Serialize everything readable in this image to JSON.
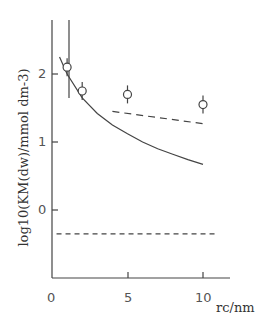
{
  "chart_data": {
    "type": "scatter",
    "title": "",
    "xlabel": "r_c/nm",
    "ylabel": "log10(KM(dw)/mmol dm-3)",
    "xlim": [
      0,
      11
    ],
    "ylim": [
      -1,
      2.8
    ],
    "xticks": [
      "0",
      "5",
      "10"
    ],
    "yticks": [
      "0",
      "1",
      "2"
    ],
    "grid": false,
    "series": [
      {
        "name": "experimental",
        "style": "open circles with error bars",
        "x": [
          1,
          2,
          5,
          10
        ],
        "y": [
          2.1,
          1.75,
          1.7,
          1.55
        ]
      },
      {
        "name": "model solid curve",
        "style": "solid line",
        "x": [
          0.5,
          1,
          2,
          3,
          4,
          5,
          6,
          7,
          8,
          9,
          10
        ],
        "y": [
          2.25,
          2.0,
          1.65,
          1.42,
          1.25,
          1.12,
          1.0,
          0.9,
          0.82,
          0.74,
          0.67
        ]
      },
      {
        "name": "upper dashed",
        "style": "dashed line",
        "x": [
          4,
          10
        ],
        "y": [
          1.45,
          1.27
        ]
      },
      {
        "name": "lower dashed",
        "style": "dashed line",
        "x": [
          0.3,
          11
        ],
        "y": [
          -0.35,
          -0.35
        ]
      },
      {
        "name": "vertical asymptote",
        "style": "solid line",
        "x": [
          1.2,
          1.2
        ],
        "y": [
          2.8,
          1.7
        ]
      }
    ]
  },
  "labels": {
    "ylabel": "log10(KM(dw)/mmol dm-3)",
    "xlabel": "rc/nm",
    "x0": "0",
    "x5": "5",
    "x10": "10",
    "y0": "0",
    "y1": "1",
    "y2": "2"
  }
}
